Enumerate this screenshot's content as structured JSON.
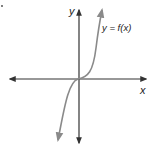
{
  "diagram": {
    "type": "function-graph",
    "axes": {
      "x_label": "x",
      "y_label": "y"
    },
    "curve_label": "y = f(x)",
    "colors": {
      "axes": "#333333",
      "curve": "#8a8a8a",
      "background": "#ffffff"
    },
    "curve_description": "Cubic-like curve passing through origin, increasing, with arrows at both ends"
  }
}
